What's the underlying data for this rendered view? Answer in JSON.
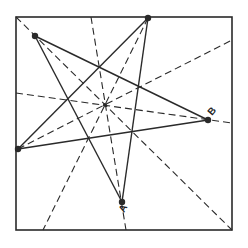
{
  "diagram": {
    "width": 248,
    "height": 248,
    "stroke_color": "#2a2a2a",
    "square": {
      "x": 16,
      "y": 17,
      "w": 216,
      "h": 213
    },
    "center": {
      "x": 105,
      "y": 105
    },
    "vertices": [
      {
        "id": "top-left",
        "x": 35,
        "y": 36,
        "label": ""
      },
      {
        "id": "top",
        "x": 148,
        "y": 18,
        "label": ""
      },
      {
        "id": "B",
        "x": 208,
        "y": 120,
        "label": "B"
      },
      {
        "id": "A",
        "x": 122,
        "y": 202,
        "label": "A"
      },
      {
        "id": "left",
        "x": 18,
        "y": 149,
        "label": ""
      }
    ],
    "star_edges": [
      [
        "top-left",
        "B"
      ],
      [
        "B",
        "left"
      ],
      [
        "left",
        "top"
      ],
      [
        "top",
        "A"
      ],
      [
        "A",
        "top-left"
      ]
    ],
    "dashed_lines": [
      {
        "x1": 16,
        "y1": 17,
        "x2": 232,
        "y2": 230
      },
      {
        "x1": 148,
        "y1": 18,
        "x2": 43,
        "y2": 230
      },
      {
        "x1": 16,
        "y1": 93,
        "x2": 232,
        "y2": 123
      },
      {
        "x1": 91,
        "y1": 17,
        "x2": 126,
        "y2": 230
      },
      {
        "x1": 18,
        "y1": 149,
        "x2": 232,
        "y2": 40
      }
    ],
    "labels": {
      "A": "A",
      "B": "B"
    }
  }
}
